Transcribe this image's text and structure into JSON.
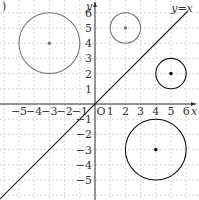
{
  "figure": {
    "label": ")",
    "x_axis_label": "x",
    "y_axis_label": "y",
    "origin_label": "O",
    "line_label": "y=x",
    "x_ticks": [
      "−5",
      "−4",
      "−3",
      "−2",
      "−1",
      "1",
      "2",
      "3",
      "4",
      "5",
      "6"
    ],
    "y_ticks": [
      "6",
      "5",
      "4",
      "3",
      "2",
      "1",
      "−1",
      "−2",
      "−3",
      "−4",
      "−5"
    ],
    "circles": [
      {
        "cx": -3,
        "cy": 4,
        "r": 2,
        "color": "#777777"
      },
      {
        "cx": 2,
        "cy": 5,
        "r": 1,
        "color": "#777777"
      },
      {
        "cx": 5,
        "cy": 2,
        "r": 1,
        "color": "#111111"
      },
      {
        "cx": 4,
        "cy": -3,
        "r": 2,
        "color": "#111111"
      }
    ]
  }
}
